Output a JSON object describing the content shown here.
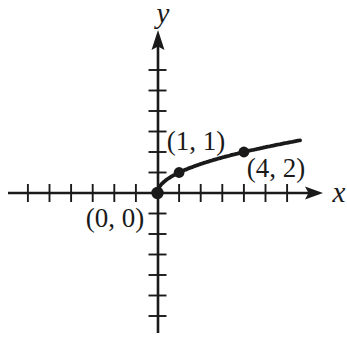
{
  "figure": {
    "background": "#ffffff",
    "ink_color": "#1a1a1a"
  },
  "chart_data": {
    "type": "line",
    "title": "",
    "xlabel": "x",
    "ylabel": "y",
    "legend": false,
    "axes": {
      "grid": false,
      "tick_labels_shown": false,
      "tick_step": 1,
      "x_ticks_negative": 6,
      "x_ticks_positive": 6,
      "y_ticks_negative": 6,
      "y_ticks_positive": 6,
      "x_range": [
        -6.9,
        7.6
      ],
      "y_range": [
        -6.8,
        7.9
      ],
      "arrows": [
        "x-positive",
        "y-positive"
      ]
    },
    "series": [
      {
        "name": "square-root-curve",
        "equation_depicted": "y = sqrt(x)",
        "x_domain": [
          0,
          6.6
        ],
        "sample_points": [
          [
            0,
            0
          ],
          [
            0.25,
            0.5
          ],
          [
            1,
            1
          ],
          [
            2.25,
            1.5
          ],
          [
            4,
            2
          ],
          [
            5.5,
            2.35
          ],
          [
            6.6,
            2.57
          ]
        ],
        "color": "#1a1a1a"
      }
    ],
    "points": [
      {
        "x": 0,
        "y": 0,
        "label": "(0, 0)",
        "label_position": "below-left"
      },
      {
        "x": 1,
        "y": 1,
        "label": "(1, 1)",
        "label_position": "above-left"
      },
      {
        "x": 4,
        "y": 2,
        "label": "(4, 2)",
        "label_position": "below-right"
      }
    ]
  }
}
